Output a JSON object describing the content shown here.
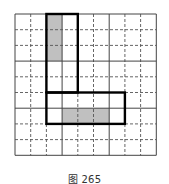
{
  "figure": {
    "caption": "图 265",
    "grid": {
      "rows": 9,
      "cols": 9,
      "origin": [
        15,
        14
      ],
      "cell_size": 15.7,
      "solid_line_every": 3,
      "line_color": "#444444",
      "dashed_line_color": "#555555"
    },
    "shape": {
      "description": "L-shaped outlined region",
      "outline_color": "#000000",
      "parts": [
        {
          "name": "vertical-bar",
          "col": 2,
          "row": 0,
          "width": 2,
          "height": 5
        },
        {
          "name": "horizontal-bar",
          "col": 2,
          "row": 5,
          "width": 5,
          "height": 2
        }
      ]
    },
    "shaded_regions": [
      {
        "name": "shaded-vertical",
        "col": 2,
        "row": 0,
        "width": 1,
        "height": 3,
        "color": "#c0c0c0"
      },
      {
        "name": "shaded-horizontal",
        "col": 3,
        "row": 6,
        "width": 3,
        "height": 1,
        "color": "#c0c0c0"
      }
    ]
  }
}
